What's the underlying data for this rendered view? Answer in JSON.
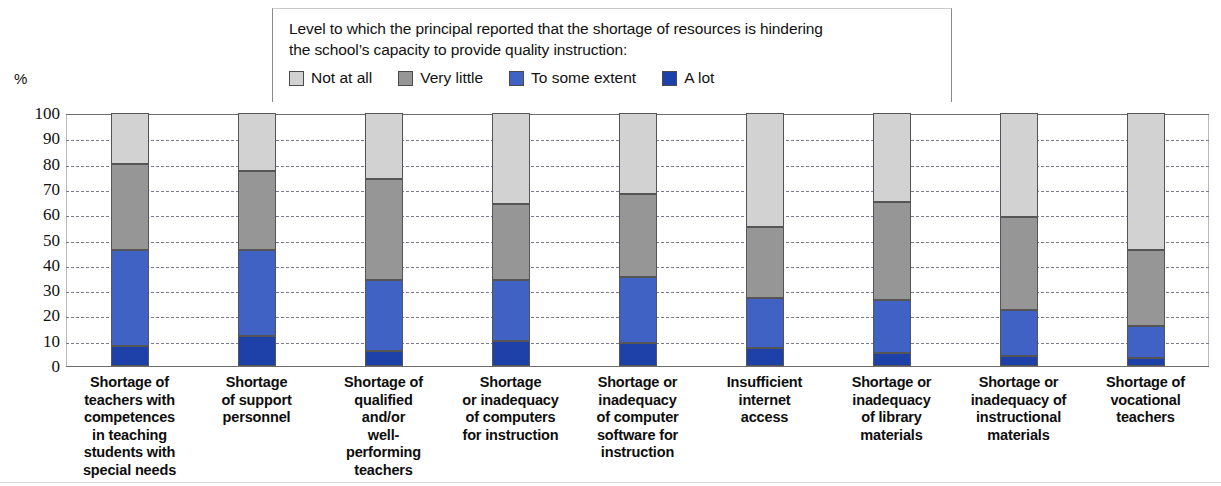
{
  "legend": {
    "note_line1": "Level to which the principal reported that the shortage of resources is hindering",
    "note_line2": "the school’s capacity to provide quality instruction:",
    "items": [
      {
        "label": "Not at all",
        "color": "#d2d2d2"
      },
      {
        "label": "Very little",
        "color": "#969696"
      },
      {
        "label": "To some extent",
        "color": "#3f62c4"
      },
      {
        "label": "A lot",
        "color": "#1d41a8"
      }
    ]
  },
  "axis": {
    "unit": "%",
    "ticks": [
      "100",
      "90",
      "80",
      "70",
      "60",
      "50",
      "40",
      "30",
      "20",
      "10",
      "0"
    ]
  },
  "chart_data": {
    "type": "bar",
    "title": "",
    "subtitle": "Level to which the principal reported that the shortage of resources is hindering the school’s capacity to provide quality instruction:",
    "xlabel": "",
    "ylabel": "%",
    "ylim": [
      0,
      100
    ],
    "grid": true,
    "stacked": true,
    "legend_position": "top",
    "categories": [
      "Shortage of teachers with competences in teaching students with special needs",
      "Shortage of support personnel",
      "Shortage of qualified and/or well-performing teachers",
      "Shortage or inadequacy of computers for instruction",
      "Shortage or inadequacy of computer software for instruction",
      "Insufficient internet access",
      "Shortage or inadequacy of library materials",
      "Shortage or inadequacy of instructional materials",
      "Shortage of vocational teachers"
    ],
    "category_lines": [
      [
        "Shortage of",
        "teachers with",
        "competences",
        "in teaching",
        "students with",
        "special needs"
      ],
      [
        "Shortage",
        "of support",
        "personnel"
      ],
      [
        "Shortage of",
        "qualified",
        "and/or",
        "well-",
        "performing",
        "teachers"
      ],
      [
        "Shortage",
        "or inadequacy",
        "of computers",
        "for instruction"
      ],
      [
        "Shortage or",
        "inadequacy",
        "of computer",
        "software for",
        "instruction"
      ],
      [
        "Insufficient",
        "internet",
        "access"
      ],
      [
        "Shortage or",
        "inadequacy",
        "of library",
        "materials"
      ],
      [
        "Shortage or",
        "inadequacy of",
        "instructional",
        "materials"
      ],
      [
        "Shortage of",
        "vocational",
        "teachers"
      ]
    ],
    "series": [
      {
        "name": "A lot",
        "color": "#1d41a8",
        "values": [
          8,
          12,
          6,
          10,
          9,
          7,
          5,
          4,
          3
        ]
      },
      {
        "name": "To some extent",
        "color": "#3f62c4",
        "values": [
          38,
          34,
          28,
          24,
          26,
          20,
          21,
          18,
          13
        ]
      },
      {
        "name": "Very little",
        "color": "#969696",
        "values": [
          34,
          31,
          40,
          30,
          33,
          28,
          39,
          37,
          30
        ]
      },
      {
        "name": "Not at all",
        "color": "#d2d2d2",
        "values": [
          20,
          23,
          26,
          36,
          32,
          45,
          35,
          41,
          54
        ]
      }
    ]
  }
}
